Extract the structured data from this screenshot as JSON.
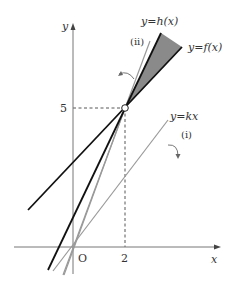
{
  "figure": {
    "axes": {
      "x_label": "x",
      "y_label": "y",
      "origin_label": "O",
      "x_tick": "2",
      "y_tick": "5"
    },
    "point": {
      "x": 2,
      "y": 5,
      "style": "open-circle"
    },
    "lines": [
      {
        "id": "h",
        "label": "y=h(x)",
        "style": "thick-black",
        "passes_through": [
          2,
          5
        ]
      },
      {
        "id": "f",
        "label": "y=f(x)",
        "style": "thick-black",
        "passes_through": [
          2,
          5
        ]
      },
      {
        "id": "kx",
        "label": "y=kx",
        "style": "gray",
        "passes_through": [
          0,
          0
        ]
      },
      {
        "id": "ii",
        "label": "(ii)",
        "style": "gray",
        "passes_through": [
          2,
          5
        ]
      },
      {
        "id": "i",
        "label": "(i)",
        "style": "gray",
        "passes_through": [
          0,
          0
        ]
      }
    ],
    "shaded_region": "between y=h(x) and y=f(x) for x > 2",
    "labels": {
      "h": "y=h(x)",
      "f": "y=f(x)",
      "kx": "y=kx",
      "ii": "(ii)",
      "i": "(i)"
    },
    "arrows": [
      {
        "name": "rotation-arrow-ii",
        "meaning": "line rotates toward (ii)"
      },
      {
        "name": "rotation-arrow-i",
        "meaning": "line rotates toward (i)"
      }
    ]
  }
}
